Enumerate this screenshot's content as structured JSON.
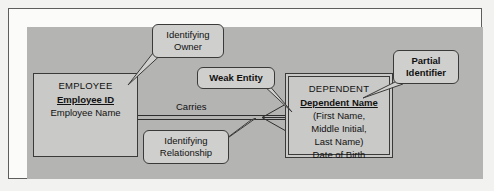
{
  "diagram": {
    "type": "er-diagram",
    "title_visible": false,
    "canvas_color": "#b4b4b2",
    "frame_color": "#5d5d5d",
    "box_fill": "#c9c9c7",
    "line_color": "#2e2e2e",
    "entities": [
      {
        "id": "employee",
        "name": "EMPLOYEE",
        "kind": "strong-entity",
        "identifier": "Employee ID",
        "attributes": [
          "Employee Name"
        ]
      },
      {
        "id": "dependent",
        "name": "DEPENDENT",
        "kind": "weak-entity",
        "identifier": "Dependent Name",
        "attributes": [
          "(First Name,",
          "Middle Initial,",
          "Last Name)",
          "Date of Birth"
        ]
      }
    ],
    "relationship": {
      "label": "Carries",
      "kind": "identifying",
      "from": "EMPLOYEE",
      "to": "DEPENDENT",
      "cardinality_to": "many"
    },
    "callouts": [
      {
        "id": "identifying-owner",
        "line1": "Identifying",
        "line2": "Owner",
        "bold": false,
        "points_to": "EMPLOYEE"
      },
      {
        "id": "weak-entity",
        "line1": "Weak Entity",
        "line2": "",
        "bold": true,
        "points_to": "DEPENDENT"
      },
      {
        "id": "partial-identifier",
        "line1": "Partial",
        "line2": "Identifier",
        "bold": true,
        "points_to": "Dependent Name"
      },
      {
        "id": "identifying-relationship",
        "line1": "Identifying",
        "line2": "Relationship",
        "bold": false,
        "points_to": "Carries"
      }
    ]
  }
}
